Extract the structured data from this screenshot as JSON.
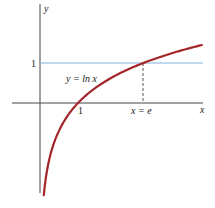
{
  "chart_data": {
    "type": "line",
    "title": "",
    "xlabel": "x",
    "ylabel": "y",
    "series": [
      {
        "name": "y = ln x",
        "color": "#a3262a",
        "function": "ln(x)",
        "x_range": [
          0.1,
          4.26
        ]
      }
    ],
    "reference_lines": [
      {
        "type": "horizontal",
        "y": 1,
        "color": "#7fb2dd",
        "style": "solid"
      },
      {
        "type": "vertical",
        "x": 2.718,
        "from_y": 0,
        "to_y": 1,
        "color": "#555555",
        "style": "dashed"
      }
    ],
    "annotations": [
      {
        "text": "y = ln x",
        "x": 1.0,
        "y": 0.65
      },
      {
        "text": "x = e",
        "x": 2.718,
        "y": -0.12
      }
    ],
    "x_ticks": [
      {
        "value": 1,
        "label": "1"
      },
      {
        "value": 2.718,
        "label": "x = e"
      }
    ],
    "y_ticks": [
      {
        "value": 1,
        "label": "1"
      }
    ],
    "xlim": [
      -0.8,
      4.5
    ],
    "ylim": [
      -2.3,
      2.5
    ],
    "grid": false,
    "legend": "none"
  },
  "labels": {
    "y_axis": "y",
    "x_axis": "x",
    "y_tick_1": "1",
    "x_tick_1": "1",
    "x_tick_e": "x = e",
    "curve_label": "y = ln x"
  },
  "colors": {
    "curve": "#a3262a",
    "reference_line": "#7fb2dd",
    "axis": "#333333"
  }
}
